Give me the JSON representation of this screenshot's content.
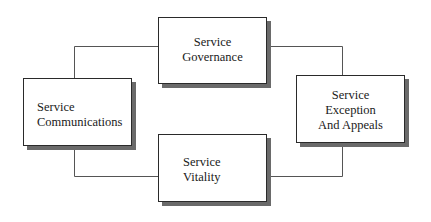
{
  "diagram": {
    "type": "cycle",
    "nodes": [
      {
        "id": "governance",
        "lines": [
          "Service",
          "Governance"
        ]
      },
      {
        "id": "exception",
        "lines": [
          "Service",
          "Exception",
          "And Appeals"
        ]
      },
      {
        "id": "vitality",
        "lines": [
          "Service",
          "Vitality"
        ]
      },
      {
        "id": "communications",
        "lines": [
          "Service",
          "Communications"
        ]
      }
    ],
    "edges": [
      {
        "from": "communications",
        "to": "governance"
      },
      {
        "from": "governance",
        "to": "exception"
      },
      {
        "from": "exception",
        "to": "vitality"
      },
      {
        "from": "vitality",
        "to": "communications"
      }
    ],
    "colors": {
      "line": "#555555",
      "border": "#2a2a2a",
      "shadow": "#6a6a6a",
      "fill": "#ffffff"
    }
  }
}
